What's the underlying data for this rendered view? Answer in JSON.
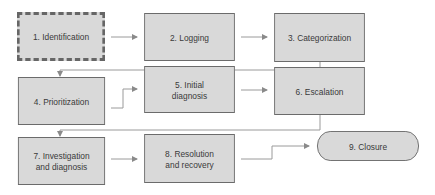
{
  "diagram": {
    "title": "",
    "colors": {
      "box_fill": "#d9d9d9",
      "box_border": "#6b6b6b",
      "connector": "#9a9a9a",
      "text": "#3a3a3a"
    },
    "nodes": [
      {
        "id": "1",
        "label": "1. Identification",
        "style": "dashed"
      },
      {
        "id": "2",
        "label": "2. Logging",
        "style": "solid"
      },
      {
        "id": "3",
        "label": "3. Categorization",
        "style": "solid"
      },
      {
        "id": "4",
        "label": "4. Prioritization",
        "style": "solid"
      },
      {
        "id": "5",
        "label": "5. Initial\ndiagnosis",
        "style": "solid"
      },
      {
        "id": "6",
        "label": "6. Escalation",
        "style": "solid"
      },
      {
        "id": "7",
        "label": "7. Investigation\nand diagnosis",
        "style": "solid"
      },
      {
        "id": "8",
        "label": "8. Resolution\nand recovery",
        "style": "solid"
      },
      {
        "id": "9",
        "label": "9. Closure",
        "style": "terminator"
      }
    ],
    "edges": [
      {
        "from": "1",
        "to": "2"
      },
      {
        "from": "2",
        "to": "3"
      },
      {
        "from": "3",
        "to": "4"
      },
      {
        "from": "4",
        "to": "5"
      },
      {
        "from": "5",
        "to": "6"
      },
      {
        "from": "6",
        "to": "7"
      },
      {
        "from": "7",
        "to": "8"
      },
      {
        "from": "8",
        "to": "9"
      }
    ]
  }
}
